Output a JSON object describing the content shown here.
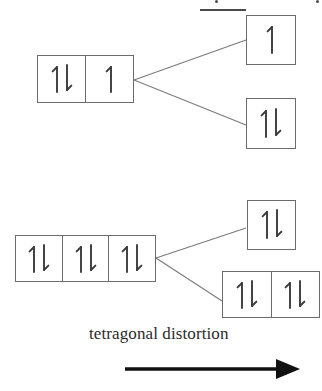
{
  "figure": {
    "caption": "tetragonal distortion",
    "arrow_label": "process-arrow-right",
    "line_color": "#6b6b6b",
    "glyph_color": "#3a3a3a",
    "text_color": "#2b2b2b",
    "background": "#ffffff"
  },
  "glyphs": {
    "paired": "↑↓",
    "single_up": "↑"
  },
  "levels": [
    {
      "id": "left-upper",
      "role": "initial-state-upper",
      "side": "left",
      "cells": [
        {
          "occupancy": "paired",
          "label": "↑↓"
        },
        {
          "occupancy": "single_up",
          "label": "↑"
        }
      ]
    },
    {
      "id": "right-upper-top",
      "role": "split-state-upper-high",
      "side": "right",
      "cells": [
        {
          "occupancy": "single_up",
          "label": "↑"
        }
      ]
    },
    {
      "id": "right-upper-bottom",
      "role": "split-state-upper-low",
      "side": "right",
      "cells": [
        {
          "occupancy": "paired",
          "label": "↑↓"
        }
      ]
    },
    {
      "id": "left-lower",
      "role": "initial-state-lower",
      "side": "left",
      "cells": [
        {
          "occupancy": "paired",
          "label": "↑↓"
        },
        {
          "occupancy": "paired",
          "label": "↑↓"
        },
        {
          "occupancy": "paired",
          "label": "↑↓"
        }
      ]
    },
    {
      "id": "right-lower-top",
      "role": "split-state-lower-high",
      "side": "right",
      "cells": [
        {
          "occupancy": "paired",
          "label": "↑↓"
        }
      ]
    },
    {
      "id": "right-lower-bottom",
      "role": "split-state-lower-low",
      "side": "right",
      "cells": [
        {
          "occupancy": "paired",
          "label": "↑↓"
        },
        {
          "occupancy": "paired",
          "label": "↑↓"
        }
      ]
    }
  ],
  "connectors": [
    {
      "id": "upper-fan-top",
      "from": "left-upper",
      "to": "right-upper-top"
    },
    {
      "id": "upper-fan-bottom",
      "from": "left-upper",
      "to": "right-upper-bottom"
    },
    {
      "id": "lower-fan-top",
      "from": "left-lower",
      "to": "right-lower-top"
    },
    {
      "id": "lower-fan-bottom",
      "from": "left-lower",
      "to": "right-lower-bottom"
    }
  ]
}
